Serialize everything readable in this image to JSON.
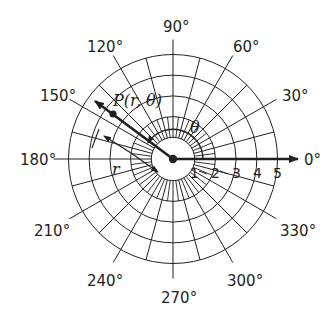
{
  "diagram": {
    "center": {
      "x": 173,
      "y": 159
    },
    "ring_spacing_px": 20.7,
    "rings": [
      1,
      2,
      3,
      4,
      5
    ],
    "ring_labels": [
      "1",
      "2",
      "3",
      "4",
      "5"
    ],
    "angle_labels": [
      {
        "deg": 0,
        "text": "0°"
      },
      {
        "deg": 30,
        "text": "30°"
      },
      {
        "deg": 60,
        "text": "60°"
      },
      {
        "deg": 90,
        "text": "90°"
      },
      {
        "deg": 120,
        "text": "120°"
      },
      {
        "deg": 150,
        "text": "150°"
      },
      {
        "deg": 180,
        "text": "180°"
      },
      {
        "deg": 210,
        "text": "210°"
      },
      {
        "deg": 240,
        "text": "240°"
      },
      {
        "deg": 270,
        "text": "270°"
      },
      {
        "deg": 300,
        "text": "300°"
      },
      {
        "deg": 330,
        "text": "330°"
      }
    ],
    "point": {
      "label": "P(r, θ)",
      "angle_deg": 150,
      "radius_units": 3.0
    },
    "theta_label": "θ",
    "r_label": "r",
    "polar_axis_label": "0°",
    "colors": {
      "line": "#231f20",
      "background": "#ffffff"
    }
  }
}
